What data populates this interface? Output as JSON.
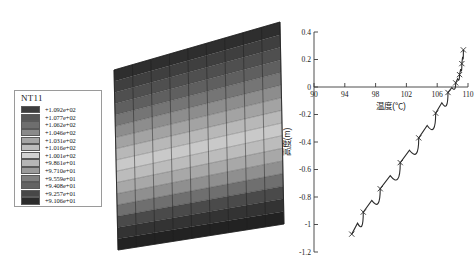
{
  "legend": {
    "title": "NT11",
    "entries": [
      {
        "label": "+1.092e+02",
        "color": "#3d3d3d"
      },
      {
        "label": "+1.077e+02",
        "color": "#565656"
      },
      {
        "label": "+1.062e+02",
        "color": "#6e6e6e"
      },
      {
        "label": "+1.046e+02",
        "color": "#8a8a8a"
      },
      {
        "label": "+1.031e+02",
        "color": "#a5a5a5"
      },
      {
        "label": "+1.016e+02",
        "color": "#bdbdbd"
      },
      {
        "label": "+1.001e+02",
        "color": "#d2d2d2"
      },
      {
        "label": "+9.861e+01",
        "color": "#b6b6b6"
      },
      {
        "label": "+9.710e+01",
        "color": "#9b9b9b"
      },
      {
        "label": "+9.559e+01",
        "color": "#7f7f7f"
      },
      {
        "label": "+9.408e+01",
        "color": "#636363"
      },
      {
        "label": "+9.257e+01",
        "color": "#474747"
      },
      {
        "label": "+9.106e+01",
        "color": "#2b2b2b"
      }
    ]
  },
  "contour_plot": {
    "name": "nt11-contour-mesh",
    "bands": [
      {
        "color": "#2e2e2e"
      },
      {
        "color": "#3f3f3f"
      },
      {
        "color": "#4f4f4f"
      },
      {
        "color": "#5f5f5f"
      },
      {
        "color": "#757575"
      },
      {
        "color": "#8d8d8d"
      },
      {
        "color": "#a3a3a3"
      },
      {
        "color": "#b8b8b8"
      },
      {
        "color": "#c9c9c9"
      },
      {
        "color": "#bcbcbc"
      },
      {
        "color": "#a8a8a8"
      },
      {
        "color": "#8f8f8f"
      },
      {
        "color": "#6f6f6f"
      },
      {
        "color": "#4a4a4a"
      },
      {
        "color": "#333333"
      },
      {
        "color": "#222222"
      }
    ],
    "mesh_color": "#1d1d1d",
    "columns": 9,
    "rows": 16
  },
  "chart_data": {
    "type": "line",
    "title": "",
    "xlabel": "温度(℃)",
    "ylabel": "高度(m)",
    "xlim": [
      90,
      110
    ],
    "ylim": [
      -1.2,
      0.4
    ],
    "xticks": [
      90,
      94,
      98,
      102,
      106,
      110
    ],
    "xtick_labels": [
      "90",
      "94",
      "98",
      "102",
      "106",
      "110"
    ],
    "yticks": [
      0.4,
      0.2,
      0,
      -0.2,
      -0.4,
      -0.6,
      -0.8,
      -1,
      -1.2
    ],
    "ytick_labels": [
      "0.4",
      "0.2",
      "0",
      "-0.2",
      "-0.4",
      "-0.6",
      "-0.8",
      "-1",
      "-1.2"
    ],
    "grid": false,
    "legend": "none",
    "marker": "x",
    "series": [
      {
        "name": "temperature-height-profile",
        "x": [
          109.4,
          109.2,
          108.9,
          108.4,
          107.4,
          105.8,
          103.6,
          101.2,
          98.6,
          96.4,
          94.9
        ],
        "y": [
          0.27,
          0.17,
          0.09,
          0.03,
          -0.04,
          -0.19,
          -0.37,
          -0.55,
          -0.74,
          -0.91,
          -1.07
        ]
      }
    ]
  }
}
